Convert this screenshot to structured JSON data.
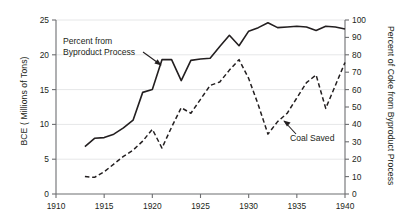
{
  "chart_data": {
    "type": "line",
    "title": "",
    "xlabel": "",
    "ylabel": "BCE ( Millions of Tons)",
    "ylabel_right": "Percent of Coke from Byproduct Process",
    "xlim": [
      1910,
      1940
    ],
    "ylim": [
      0,
      25
    ],
    "ylim_right": [
      0,
      100
    ],
    "xticks": [
      1910,
      1915,
      1920,
      1925,
      1930,
      1935,
      1940
    ],
    "xtick_labels": [
      "1910",
      "1915",
      "1920",
      "1925",
      "1930",
      "1935",
      "1940"
    ],
    "yticks": [
      0,
      5,
      10,
      15,
      20,
      25
    ],
    "ytick_labels": [
      "0",
      "5",
      "10",
      "15",
      "20",
      "25"
    ],
    "yticks_right": [
      0,
      10,
      20,
      30,
      40,
      50,
      60,
      70,
      80,
      90,
      100
    ],
    "ytick_labels_right": [
      "0",
      "10",
      "20",
      "30",
      "40",
      "50",
      "60",
      "70",
      "80",
      "90",
      "100"
    ],
    "grid": "horizontal",
    "legend": "none",
    "line_color": "#231f20",
    "series": [
      {
        "name": "Percent from Byproduct Process",
        "style": "solid",
        "axis": "right",
        "units": "percent",
        "x": [
          1913,
          1914,
          1915,
          1916,
          1917,
          1918,
          1919,
          1920,
          1921,
          1922,
          1923,
          1924,
          1925,
          1926,
          1927,
          1928,
          1929,
          1930,
          1931,
          1932,
          1933,
          1934,
          1935,
          1936,
          1937,
          1938,
          1939,
          1940
        ],
        "values": [
          27.2,
          32.0,
          32.4,
          34.4,
          38.0,
          42.4,
          58.4,
          60.0,
          77.2,
          77.2,
          65.2,
          76.8,
          77.6,
          78.0,
          84.8,
          91.2,
          85.2,
          93.6,
          95.6,
          98.4,
          95.6,
          96.0,
          96.4,
          96.0,
          94.0,
          96.4,
          96.0,
          94.8
        ]
      },
      {
        "name": "Coal Saved",
        "style": "dashed",
        "axis": "left",
        "units": "million tons BCE",
        "x": [
          1913,
          1914,
          1915,
          1916,
          1917,
          1918,
          1919,
          1920,
          1921,
          1922,
          1923,
          1924,
          1925,
          1926,
          1927,
          1928,
          1929,
          1930,
          1931,
          1932,
          1933,
          1934,
          1935,
          1936,
          1937,
          1938,
          1939,
          1940
        ],
        "values": [
          2.5,
          2.4,
          3.2,
          4.3,
          5.4,
          6.3,
          7.6,
          9.3,
          6.6,
          9.6,
          12.4,
          11.6,
          13.6,
          15.6,
          16.1,
          17.8,
          19.3,
          16.6,
          12.8,
          8.6,
          10.4,
          11.6,
          13.8,
          16.0,
          17.1,
          12.3,
          15.6,
          18.9
        ]
      }
    ],
    "annotations": [
      {
        "text_line1": "Percent from",
        "text_line2": "Byproduct Process",
        "arrow": "down-right",
        "points_to_series": "Percent from Byproduct Process"
      },
      {
        "text_line1": "Coal Saved",
        "text_line2": "",
        "arrow": "up-left",
        "points_to_series": "Coal Saved"
      }
    ]
  }
}
